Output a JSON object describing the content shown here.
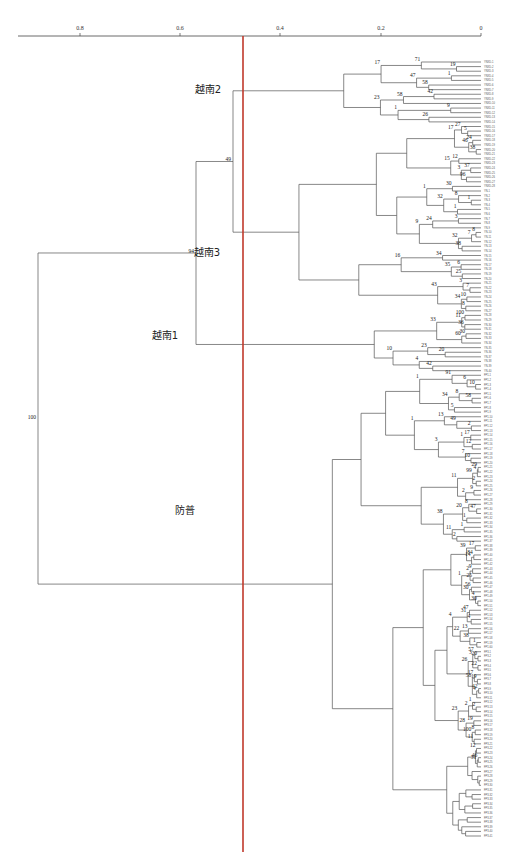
{
  "figure": {
    "type": "dendrogram",
    "axis": {
      "ticks": [
        {
          "label": "0.8",
          "x": 80
        },
        {
          "label": "0.6",
          "x": 180
        },
        {
          "label": "0.4",
          "x": 280
        },
        {
          "label": "0.2",
          "x": 381
        },
        {
          "label": "0",
          "x": 481
        }
      ],
      "line_x1": 18,
      "line_x2": 481,
      "line_y": 36
    },
    "cutoff_line": {
      "x": 243,
      "color": "#c0392b"
    },
    "clades": [
      {
        "label": "越南2",
        "x": 208,
        "y": 93
      },
      {
        "label": "越南3",
        "x": 207,
        "y": 256
      },
      {
        "label": "越南1",
        "x": 165,
        "y": 339
      },
      {
        "label": "防普",
        "x": 185,
        "y": 514
      }
    ],
    "root_support": "100",
    "major_supports": [
      {
        "label": "94",
        "x": 191,
        "y": 256
      },
      {
        "label": "49",
        "x": 231,
        "y": 194
      },
      {
        "label": "55",
        "x": 264,
        "y": 337
      },
      {
        "label": "97",
        "x": 306,
        "y": 515
      },
      {
        "label": "2",
        "x": 325,
        "y": 645
      }
    ],
    "leaf_groups": [
      {
        "prefix": "YNXD",
        "count": 28
      },
      {
        "prefix": "YN",
        "count": 40
      },
      {
        "prefix": "FP1",
        "count": 60
      },
      {
        "prefix": "FP3",
        "count": 41
      }
    ]
  },
  "chart_data": {
    "type": "dendrogram",
    "title": "",
    "xlabel": "",
    "x_axis_ticks": [
      "0.8",
      "0.6",
      "0.4",
      "0.2",
      "0"
    ],
    "x_range": [
      0.9,
      0
    ],
    "cutoff_value": 0.47,
    "clusters": [
      {
        "name": "越南2",
        "leaf_prefix": "YNXD",
        "support": 49
      },
      {
        "name": "越南3",
        "leaf_prefix": "YNXD/YN",
        "support": 94
      },
      {
        "name": "越南1",
        "leaf_prefix": "YN",
        "support": 55
      },
      {
        "name": "防普",
        "leaf_prefix": "FP",
        "support": 97
      }
    ],
    "root_support": 100,
    "node_support_values": [
      19,
      71,
      1,
      58,
      47,
      17,
      42,
      58,
      9,
      26,
      1,
      23,
      5,
      27,
      24,
      38,
      46,
      17,
      12,
      37,
      96,
      3,
      15,
      30,
      1,
      8,
      1,
      32,
      1,
      3,
      24,
      8,
      7,
      38,
      32,
      9,
      34,
      6,
      25,
      35,
      16,
      7,
      3,
      10,
      8,
      34,
      43,
      100,
      36,
      11,
      30,
      60,
      33,
      20,
      23,
      42,
      4,
      10,
      10,
      6,
      91,
      58,
      8,
      5,
      34,
      1,
      2,
      49,
      13,
      17,
      12,
      1,
      10,
      7,
      3,
      1,
      29,
      4,
      2,
      99,
      9,
      2,
      11,
      47,
      8,
      1,
      20,
      1,
      2,
      11,
      38,
      17,
      84,
      14,
      39,
      9,
      25,
      2,
      56,
      30,
      4,
      30,
      1,
      47,
      4,
      31,
      13,
      1,
      38,
      22,
      4,
      20,
      57,
      22,
      3,
      19,
      17,
      42,
      4,
      58,
      26,
      2,
      1,
      2,
      19,
      8,
      11,
      100,
      28,
      23,
      12,
      46,
      31
    ]
  }
}
